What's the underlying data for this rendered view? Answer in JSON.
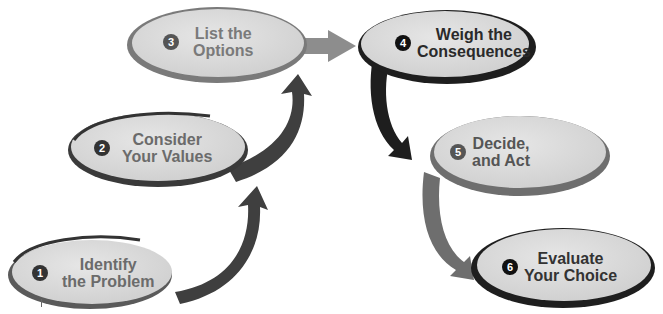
{
  "diagram": {
    "type": "decision-making-process",
    "steps": [
      {
        "number": "1",
        "line1": "Identify",
        "line2": "the Problem"
      },
      {
        "number": "2",
        "line1": "Consider",
        "line2": "Your Values"
      },
      {
        "number": "3",
        "line1": "List the",
        "line2": "Options"
      },
      {
        "number": "4",
        "line1": "Weigh the",
        "line2": "Consequences"
      },
      {
        "number": "5",
        "line1": "Decide,",
        "line2": "and Act"
      },
      {
        "number": "6",
        "line1": "Evaluate",
        "line2": "Your Choice"
      }
    ],
    "colors": {
      "ellipse_fill": "#d9d9d9",
      "ring_dark": "#1e1e1e",
      "ring_mid": "#6d6d6d",
      "arrow_dark": "#3a3a3a",
      "arrow_light": "#8a8a8a",
      "text_light": "#6b6b6b",
      "text_dark": "#2a2a2a"
    }
  }
}
